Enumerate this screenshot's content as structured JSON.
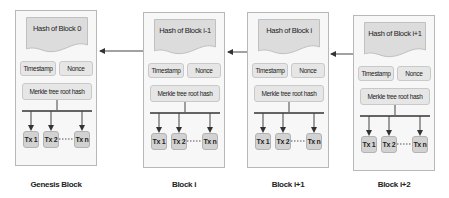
{
  "diagram": {
    "type": "blockchain-structure",
    "blocks": [
      {
        "caption": "Genesis Block",
        "hash_label": "Hash of Block 0",
        "timestamp_label": "Timestamp",
        "nonce_label": "Nonce",
        "merkle_label": "Merkle tree root hash",
        "transactions": [
          "Tx 1",
          "Tx 2",
          "Tx n"
        ]
      },
      {
        "caption": "Block i",
        "hash_label": "Hash of Block i-1",
        "timestamp_label": "Timestamp",
        "nonce_label": "Nonce",
        "merkle_label": "Merkle tree root hash",
        "transactions": [
          "Tx 1",
          "Tx 2",
          "Tx n"
        ]
      },
      {
        "caption": "Block i+1",
        "hash_label": "Hash of Block i",
        "timestamp_label": "Timestamp",
        "nonce_label": "Nonce",
        "merkle_label": "Merkle tree root hash",
        "transactions": [
          "Tx 1",
          "Tx 2",
          "Tx n"
        ]
      },
      {
        "caption": "Block i+2",
        "hash_label": "Hash of Block i+1",
        "timestamp_label": "Timestamp",
        "nonce_label": "Nonce",
        "merkle_label": "Merkle tree root hash",
        "transactions": [
          "Tx 1",
          "Tx 2",
          "Tx n"
        ]
      }
    ],
    "links": [
      {
        "from": "Block i",
        "to": "Genesis Block"
      },
      {
        "from": "Block i+1",
        "to": "Block i"
      },
      {
        "from": "Block i+2",
        "to": "Block i+1"
      }
    ],
    "colors": {
      "block_fill": "#f7f7f7",
      "block_border": "#b8b8b8",
      "cell_fill": "#e6e6e6",
      "tx_fill": "#d2d2d2",
      "line": "#333333"
    }
  }
}
